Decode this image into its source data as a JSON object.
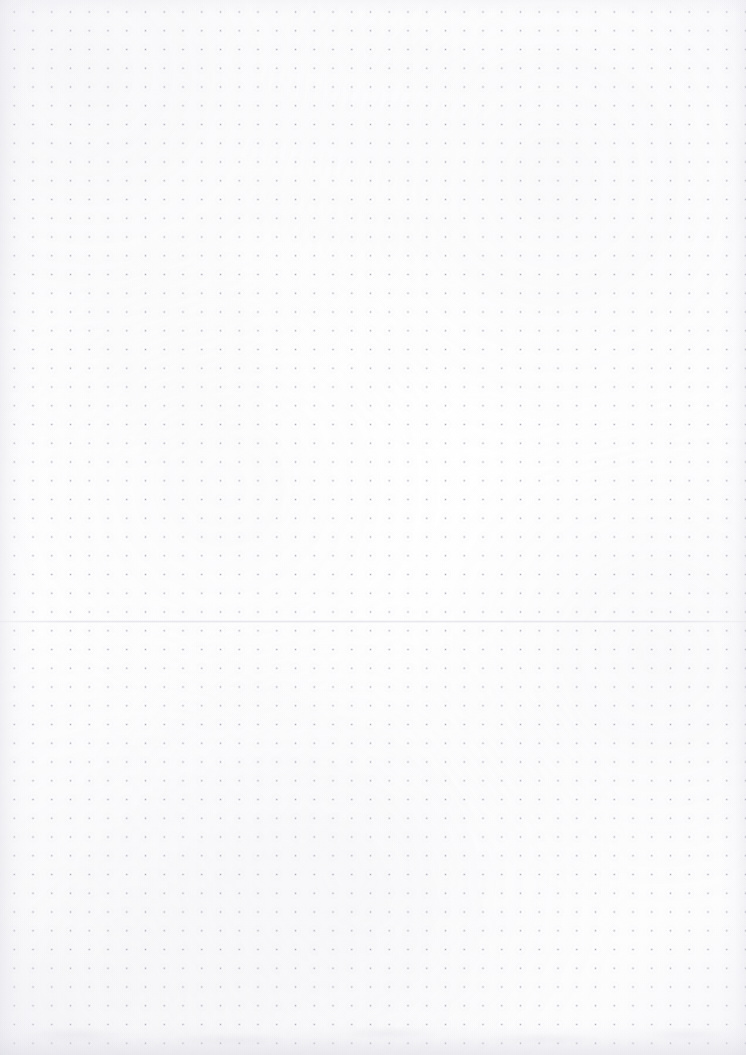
{
  "page": {
    "kind": "blank-dot-grid-notebook-page",
    "width": 746,
    "height": 1055,
    "background_color": "#fdfdfe",
    "has_text": false,
    "has_handwriting": false,
    "visible_text": ""
  },
  "grid": {
    "style": "dot",
    "dot_color": "#a8a8b4",
    "dot_halo_color": "#cecede",
    "dot_size_px": 1.5,
    "spacing_px": 18.75,
    "origin_x_px": 33,
    "origin_y_px": 12,
    "columns": 38,
    "rows": 54,
    "last_column_x_px": 727,
    "last_row_y_px": 1015
  },
  "margins": {
    "left_px": 33,
    "right_px": 19,
    "top_px": 12,
    "bottom_px": 40
  },
  "artifacts": {
    "seam": {
      "name": "horizontal-fold-seam",
      "orientation": "horizontal",
      "y_px": 621,
      "color": "#d4d4de",
      "spans_full_width": true
    },
    "edge_shadows": {
      "left_color": "#d4d4de",
      "right_color": "#d6d6e0",
      "top_color": "#e2e2ea",
      "bottom_color": "#cecdd8"
    },
    "bottom_texture": {
      "name": "bottom-smudge-band",
      "height_px": 34,
      "color": "#c0c0cb"
    }
  }
}
